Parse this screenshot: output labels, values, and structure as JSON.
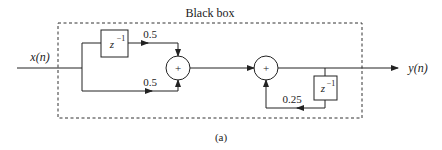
{
  "title": "Black box",
  "caption": "(a)",
  "input_label": "x(n)",
  "output_label": "y(n)",
  "delay_label_base": "z",
  "delay_label_exp": "−1",
  "adder_symbol": "+",
  "gains": {
    "top_branch": "0.5",
    "bottom_branch": "0.5",
    "feedback": "0.25"
  },
  "colors": {
    "line": "#222222",
    "background": "#ffffff"
  }
}
